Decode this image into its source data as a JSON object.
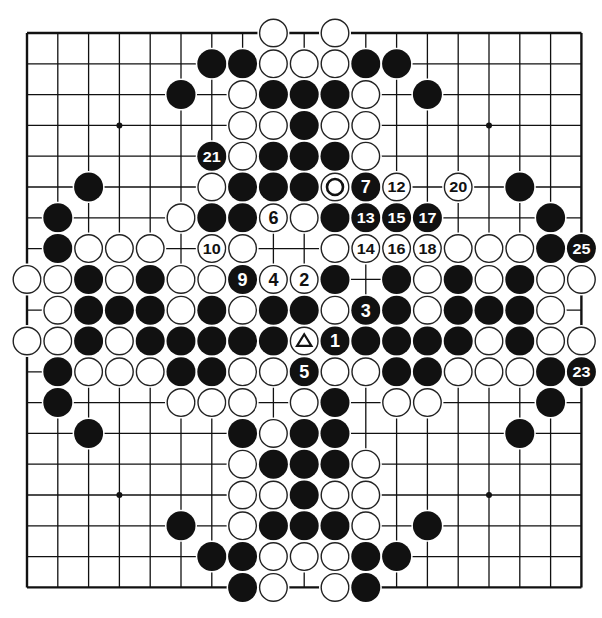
{
  "board": {
    "size": 19,
    "origin_x": 27,
    "origin_y": 33,
    "spacing": 30.8,
    "stone_radius": 14.5,
    "line_color": "#111111",
    "background": "#ffffff",
    "black_color": "#111111",
    "white_color": "#ffffff",
    "hoshi": [
      [
        3,
        3
      ],
      [
        9,
        3
      ],
      [
        15,
        3
      ],
      [
        3,
        15
      ],
      [
        9,
        15
      ],
      [
        15,
        15
      ]
    ]
  },
  "stones": [
    {
      "c": 8,
      "r": 0,
      "color": "W"
    },
    {
      "c": 10,
      "r": 0,
      "color": "W"
    },
    {
      "c": 6,
      "r": 1,
      "color": "B"
    },
    {
      "c": 7,
      "r": 1,
      "color": "B"
    },
    {
      "c": 8,
      "r": 1,
      "color": "W"
    },
    {
      "c": 9,
      "r": 1,
      "color": "W"
    },
    {
      "c": 10,
      "r": 1,
      "color": "W"
    },
    {
      "c": 11,
      "r": 1,
      "color": "B"
    },
    {
      "c": 12,
      "r": 1,
      "color": "B"
    },
    {
      "c": 5,
      "r": 2,
      "color": "B"
    },
    {
      "c": 7,
      "r": 2,
      "color": "W"
    },
    {
      "c": 8,
      "r": 2,
      "color": "B"
    },
    {
      "c": 9,
      "r": 2,
      "color": "B"
    },
    {
      "c": 10,
      "r": 2,
      "color": "B"
    },
    {
      "c": 11,
      "r": 2,
      "color": "W"
    },
    {
      "c": 13,
      "r": 2,
      "color": "B"
    },
    {
      "c": 7,
      "r": 3,
      "color": "W"
    },
    {
      "c": 8,
      "r": 3,
      "color": "W"
    },
    {
      "c": 9,
      "r": 3,
      "color": "B"
    },
    {
      "c": 10,
      "r": 3,
      "color": "W"
    },
    {
      "c": 11,
      "r": 3,
      "color": "W"
    },
    {
      "c": 6,
      "r": 4,
      "color": "B",
      "label": "21"
    },
    {
      "c": 7,
      "r": 4,
      "color": "W"
    },
    {
      "c": 8,
      "r": 4,
      "color": "B"
    },
    {
      "c": 9,
      "r": 4,
      "color": "B"
    },
    {
      "c": 10,
      "r": 4,
      "color": "B"
    },
    {
      "c": 11,
      "r": 4,
      "color": "W"
    },
    {
      "c": 2,
      "r": 5,
      "color": "B"
    },
    {
      "c": 6,
      "r": 5,
      "color": "W"
    },
    {
      "c": 7,
      "r": 5,
      "color": "B"
    },
    {
      "c": 8,
      "r": 5,
      "color": "B"
    },
    {
      "c": 9,
      "r": 5,
      "color": "B"
    },
    {
      "c": 10,
      "r": 5,
      "color": "W",
      "mark": "circle"
    },
    {
      "c": 11,
      "r": 5,
      "color": "B",
      "label": "7"
    },
    {
      "c": 12,
      "r": 5,
      "color": "W",
      "label": "12"
    },
    {
      "c": 14,
      "r": 5,
      "color": "W",
      "label": "20"
    },
    {
      "c": 16,
      "r": 5,
      "color": "B"
    },
    {
      "c": 1,
      "r": 6,
      "color": "B"
    },
    {
      "c": 5,
      "r": 6,
      "color": "W"
    },
    {
      "c": 6,
      "r": 6,
      "color": "B"
    },
    {
      "c": 7,
      "r": 6,
      "color": "B"
    },
    {
      "c": 8,
      "r": 6,
      "color": "W",
      "label": "6"
    },
    {
      "c": 9,
      "r": 6,
      "color": "W"
    },
    {
      "c": 10,
      "r": 6,
      "color": "B"
    },
    {
      "c": 11,
      "r": 6,
      "color": "B",
      "label": "13"
    },
    {
      "c": 12,
      "r": 6,
      "color": "B",
      "label": "15"
    },
    {
      "c": 13,
      "r": 6,
      "color": "B",
      "label": "17"
    },
    {
      "c": 17,
      "r": 6,
      "color": "B"
    },
    {
      "c": 1,
      "r": 7,
      "color": "B"
    },
    {
      "c": 2,
      "r": 7,
      "color": "W"
    },
    {
      "c": 3,
      "r": 7,
      "color": "W"
    },
    {
      "c": 4,
      "r": 7,
      "color": "W"
    },
    {
      "c": 6,
      "r": 7,
      "color": "W",
      "label": "10"
    },
    {
      "c": 7,
      "r": 7,
      "color": "W"
    },
    {
      "c": 10,
      "r": 7,
      "color": "W"
    },
    {
      "c": 11,
      "r": 7,
      "color": "W",
      "label": "14"
    },
    {
      "c": 12,
      "r": 7,
      "color": "W",
      "label": "16"
    },
    {
      "c": 13,
      "r": 7,
      "color": "W",
      "label": "18"
    },
    {
      "c": 14,
      "r": 7,
      "color": "W"
    },
    {
      "c": 15,
      "r": 7,
      "color": "W"
    },
    {
      "c": 16,
      "r": 7,
      "color": "W"
    },
    {
      "c": 17,
      "r": 7,
      "color": "B"
    },
    {
      "c": 18,
      "r": 7,
      "color": "B",
      "label": "25"
    },
    {
      "c": 0,
      "r": 8,
      "color": "W"
    },
    {
      "c": 1,
      "r": 8,
      "color": "W"
    },
    {
      "c": 2,
      "r": 8,
      "color": "B"
    },
    {
      "c": 3,
      "r": 8,
      "color": "W"
    },
    {
      "c": 4,
      "r": 8,
      "color": "B"
    },
    {
      "c": 5,
      "r": 8,
      "color": "W"
    },
    {
      "c": 6,
      "r": 8,
      "color": "W"
    },
    {
      "c": 7,
      "r": 8,
      "color": "B",
      "label": "9"
    },
    {
      "c": 8,
      "r": 8,
      "color": "W",
      "label": "4"
    },
    {
      "c": 9,
      "r": 8,
      "color": "W",
      "label": "2"
    },
    {
      "c": 10,
      "r": 8,
      "color": "B"
    },
    {
      "c": 12,
      "r": 8,
      "color": "B"
    },
    {
      "c": 13,
      "r": 8,
      "color": "W"
    },
    {
      "c": 14,
      "r": 8,
      "color": "B"
    },
    {
      "c": 15,
      "r": 8,
      "color": "W"
    },
    {
      "c": 16,
      "r": 8,
      "color": "B"
    },
    {
      "c": 17,
      "r": 8,
      "color": "W"
    },
    {
      "c": 18,
      "r": 8,
      "color": "W"
    },
    {
      "c": 1,
      "r": 9,
      "color": "W"
    },
    {
      "c": 2,
      "r": 9,
      "color": "B"
    },
    {
      "c": 3,
      "r": 9,
      "color": "B"
    },
    {
      "c": 4,
      "r": 9,
      "color": "B"
    },
    {
      "c": 5,
      "r": 9,
      "color": "W"
    },
    {
      "c": 6,
      "r": 9,
      "color": "B"
    },
    {
      "c": 7,
      "r": 9,
      "color": "W"
    },
    {
      "c": 8,
      "r": 9,
      "color": "B"
    },
    {
      "c": 9,
      "r": 9,
      "color": "B"
    },
    {
      "c": 10,
      "r": 9,
      "color": "W"
    },
    {
      "c": 11,
      "r": 9,
      "color": "B",
      "label": "3"
    },
    {
      "c": 12,
      "r": 9,
      "color": "B"
    },
    {
      "c": 13,
      "r": 9,
      "color": "W"
    },
    {
      "c": 14,
      "r": 9,
      "color": "B"
    },
    {
      "c": 15,
      "r": 9,
      "color": "B"
    },
    {
      "c": 16,
      "r": 9,
      "color": "B"
    },
    {
      "c": 17,
      "r": 9,
      "color": "W"
    },
    {
      "c": 0,
      "r": 10,
      "color": "W"
    },
    {
      "c": 1,
      "r": 10,
      "color": "W"
    },
    {
      "c": 2,
      "r": 10,
      "color": "B"
    },
    {
      "c": 3,
      "r": 10,
      "color": "W"
    },
    {
      "c": 4,
      "r": 10,
      "color": "B"
    },
    {
      "c": 5,
      "r": 10,
      "color": "B"
    },
    {
      "c": 6,
      "r": 10,
      "color": "B"
    },
    {
      "c": 7,
      "r": 10,
      "color": "B"
    },
    {
      "c": 8,
      "r": 10,
      "color": "B"
    },
    {
      "c": 9,
      "r": 10,
      "color": "W",
      "mark": "triangle"
    },
    {
      "c": 10,
      "r": 10,
      "color": "B",
      "label": "1"
    },
    {
      "c": 11,
      "r": 10,
      "color": "B"
    },
    {
      "c": 12,
      "r": 10,
      "color": "B"
    },
    {
      "c": 13,
      "r": 10,
      "color": "B"
    },
    {
      "c": 14,
      "r": 10,
      "color": "B"
    },
    {
      "c": 15,
      "r": 10,
      "color": "W"
    },
    {
      "c": 16,
      "r": 10,
      "color": "B"
    },
    {
      "c": 17,
      "r": 10,
      "color": "W"
    },
    {
      "c": 18,
      "r": 10,
      "color": "W"
    },
    {
      "c": 1,
      "r": 11,
      "color": "B"
    },
    {
      "c": 2,
      "r": 11,
      "color": "W"
    },
    {
      "c": 3,
      "r": 11,
      "color": "W"
    },
    {
      "c": 4,
      "r": 11,
      "color": "W"
    },
    {
      "c": 5,
      "r": 11,
      "color": "B"
    },
    {
      "c": 6,
      "r": 11,
      "color": "B"
    },
    {
      "c": 7,
      "r": 11,
      "color": "W"
    },
    {
      "c": 8,
      "r": 11,
      "color": "W"
    },
    {
      "c": 9,
      "r": 11,
      "color": "B",
      "label": "5"
    },
    {
      "c": 10,
      "r": 11,
      "color": "W"
    },
    {
      "c": 11,
      "r": 11,
      "color": "W"
    },
    {
      "c": 12,
      "r": 11,
      "color": "B"
    },
    {
      "c": 13,
      "r": 11,
      "color": "B"
    },
    {
      "c": 14,
      "r": 11,
      "color": "W"
    },
    {
      "c": 15,
      "r": 11,
      "color": "W"
    },
    {
      "c": 16,
      "r": 11,
      "color": "W"
    },
    {
      "c": 17,
      "r": 11,
      "color": "B"
    },
    {
      "c": 18,
      "r": 11,
      "color": "B",
      "label": "23"
    },
    {
      "c": 1,
      "r": 12,
      "color": "B"
    },
    {
      "c": 5,
      "r": 12,
      "color": "W"
    },
    {
      "c": 6,
      "r": 12,
      "color": "W"
    },
    {
      "c": 7,
      "r": 12,
      "color": "W"
    },
    {
      "c": 9,
      "r": 12,
      "color": "W"
    },
    {
      "c": 10,
      "r": 12,
      "color": "B"
    },
    {
      "c": 12,
      "r": 12,
      "color": "W"
    },
    {
      "c": 13,
      "r": 12,
      "color": "W"
    },
    {
      "c": 17,
      "r": 12,
      "color": "B"
    },
    {
      "c": 2,
      "r": 13,
      "color": "B"
    },
    {
      "c": 7,
      "r": 13,
      "color": "B"
    },
    {
      "c": 8,
      "r": 13,
      "color": "W"
    },
    {
      "c": 9,
      "r": 13,
      "color": "B"
    },
    {
      "c": 10,
      "r": 13,
      "color": "B"
    },
    {
      "c": 16,
      "r": 13,
      "color": "B"
    },
    {
      "c": 7,
      "r": 14,
      "color": "W"
    },
    {
      "c": 8,
      "r": 14,
      "color": "B"
    },
    {
      "c": 9,
      "r": 14,
      "color": "B"
    },
    {
      "c": 10,
      "r": 14,
      "color": "B"
    },
    {
      "c": 11,
      "r": 14,
      "color": "W"
    },
    {
      "c": 7,
      "r": 15,
      "color": "W"
    },
    {
      "c": 8,
      "r": 15,
      "color": "W"
    },
    {
      "c": 9,
      "r": 15,
      "color": "B"
    },
    {
      "c": 10,
      "r": 15,
      "color": "W"
    },
    {
      "c": 11,
      "r": 15,
      "color": "W"
    },
    {
      "c": 5,
      "r": 16,
      "color": "B"
    },
    {
      "c": 7,
      "r": 16,
      "color": "W"
    },
    {
      "c": 8,
      "r": 16,
      "color": "B"
    },
    {
      "c": 9,
      "r": 16,
      "color": "B"
    },
    {
      "c": 10,
      "r": 16,
      "color": "B"
    },
    {
      "c": 11,
      "r": 16,
      "color": "W"
    },
    {
      "c": 13,
      "r": 16,
      "color": "B"
    },
    {
      "c": 6,
      "r": 17,
      "color": "B"
    },
    {
      "c": 7,
      "r": 17,
      "color": "B"
    },
    {
      "c": 8,
      "r": 17,
      "color": "W"
    },
    {
      "c": 9,
      "r": 17,
      "color": "W"
    },
    {
      "c": 10,
      "r": 17,
      "color": "W"
    },
    {
      "c": 11,
      "r": 17,
      "color": "B"
    },
    {
      "c": 12,
      "r": 17,
      "color": "B"
    },
    {
      "c": 7,
      "r": 18,
      "color": "B"
    },
    {
      "c": 8,
      "r": 18,
      "color": "W"
    },
    {
      "c": 10,
      "r": 18,
      "color": "W"
    },
    {
      "c": 11,
      "r": 18,
      "color": "B"
    }
  ]
}
